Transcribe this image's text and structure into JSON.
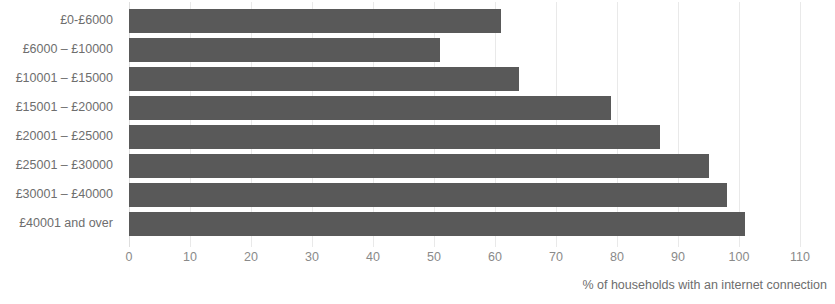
{
  "chart_data": {
    "type": "bar",
    "orientation": "horizontal",
    "title": "",
    "subtitle": "",
    "xlabel": "% of households with an internet connection",
    "ylabel": "",
    "categories": [
      "£0-£6000",
      "£6000 – £10000",
      "£10001 – £15000",
      "£15001 – £20000",
      "£20001 – £25000",
      "£25001 – £30000",
      "£30001 – £40000",
      "£40001 and over"
    ],
    "values": [
      61,
      51,
      64,
      79,
      87,
      95,
      98,
      101
    ],
    "xlim": [
      0,
      110
    ],
    "xticks": [
      0,
      10,
      20,
      30,
      40,
      50,
      60,
      70,
      80,
      90,
      100,
      110
    ],
    "xtick_labels": [
      "0",
      "10",
      "20",
      "30",
      "40",
      "50",
      "60",
      "70",
      "80",
      "90",
      "100",
      "110"
    ],
    "grid": true,
    "grid_axis": "x",
    "legend": false,
    "bar_color": "#595959",
    "gridline_color": "#e9e9e9",
    "label_color": "#6e6e6e",
    "tick_color": "#8a8a8a",
    "background": "#ffffff"
  }
}
